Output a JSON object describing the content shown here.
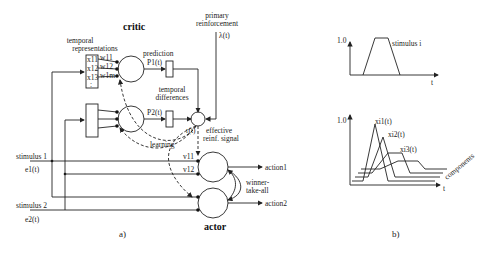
{
  "panel_a": {
    "label": "a)",
    "critic_title": "critic",
    "actor_title": "actor",
    "temporal_representations": "temporal",
    "temporal_representations_2": "representations",
    "x_labels": [
      "x11",
      "x12",
      "x13",
      ":"
    ],
    "w_labels": [
      "w11",
      "w12",
      "w1m"
    ],
    "prediction": "prediction",
    "p1": "P1(t)",
    "p2": "P2(t)",
    "temporal_differences_1": "temporal",
    "temporal_differences_2": "differences",
    "primary_reinforcement_1": "primary",
    "primary_reinforcement_2": "reinforcement",
    "lambda": "λ(t)",
    "r": "r(t)",
    "effective_1": "effective",
    "effective_2": "reinf. signal",
    "learning": "learning",
    "v11": "v11",
    "v12": "v12",
    "stimulus1": "stimulus 1",
    "e1": "e1(t)",
    "stimulus2": "stimulus 2",
    "e2": "e2(t)",
    "action1": "action1",
    "action2": "action2",
    "winner_1": "winner-",
    "winner_2": "take-all"
  },
  "panel_b": {
    "label": "b)",
    "top_y": "1.0",
    "top_t": "t",
    "stimulus_i": "stimulus i",
    "bottom_y": "1.0",
    "bottom_t": "t",
    "xi1": "xi1(t)",
    "xi2": "xi2(t)",
    "xi3": "xi3(t)",
    "components": "components"
  }
}
